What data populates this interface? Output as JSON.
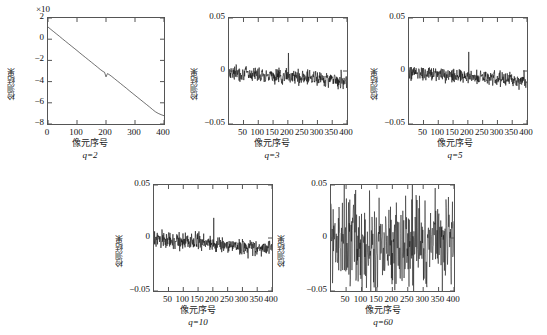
{
  "figure": {
    "axis_label_y": "检测结果",
    "axis_label_x": "像元序号",
    "exponent_note": "×10"
  },
  "chart_data": [
    {
      "type": "line",
      "title": "",
      "caption": "q=2",
      "xlabel": "像元序号",
      "ylabel": "检测结果",
      "xlim": [
        0,
        400
      ],
      "ylim": [
        -8,
        2
      ],
      "xticks": [
        0,
        100,
        200,
        300,
        400
      ],
      "yticks": [
        2,
        0,
        -2,
        -4,
        -6,
        -8
      ],
      "y_exponent": "×10",
      "grid": false,
      "legend": "none",
      "x": [
        0,
        10,
        20,
        30,
        40,
        50,
        60,
        70,
        80,
        90,
        100,
        110,
        120,
        130,
        140,
        150,
        160,
        170,
        180,
        190,
        195,
        200,
        205,
        210,
        220,
        230,
        240,
        250,
        260,
        270,
        280,
        290,
        300,
        310,
        320,
        330,
        340,
        350,
        360,
        370,
        380,
        390,
        400
      ],
      "values": [
        1.15,
        0.92,
        0.7,
        0.48,
        0.26,
        0.03,
        -0.19,
        -0.41,
        -0.63,
        -0.85,
        -1.07,
        -1.3,
        -1.52,
        -1.74,
        -1.96,
        -2.18,
        -2.4,
        -2.62,
        -2.85,
        -3.05,
        -3.12,
        -3.55,
        -3.25,
        -3.32,
        -3.52,
        -3.74,
        -3.96,
        -4.18,
        -4.4,
        -4.62,
        -4.85,
        -5.07,
        -5.29,
        -5.51,
        -5.73,
        -5.95,
        -6.17,
        -6.39,
        -6.62,
        -6.84,
        -7.0,
        -7.12,
        -7.22
      ]
    },
    {
      "type": "line",
      "title": "",
      "caption": "q=3",
      "xlabel": "像元序号",
      "ylabel": "检测结果",
      "xlim": [
        1,
        400
      ],
      "ylim": [
        -0.05,
        0.05
      ],
      "xticks": [
        50,
        100,
        150,
        200,
        250,
        300,
        350,
        400
      ],
      "yticks": [
        0.05,
        0,
        -0.05
      ],
      "grid": false,
      "legend": "none",
      "noise_amplitude": 0.0035,
      "baseline_start": -0.001,
      "baseline_end": -0.009,
      "spike_x": 202,
      "spike_y": 0.017,
      "seed": 7
    },
    {
      "type": "line",
      "title": "",
      "caption": "q=5",
      "xlabel": "像元序号",
      "ylabel": "检测结果",
      "xlim": [
        1,
        400
      ],
      "ylim": [
        -0.05,
        0.05
      ],
      "xticks": [
        50,
        100,
        150,
        200,
        250,
        300,
        350,
        400
      ],
      "yticks": [
        0.05,
        0,
        -0.05
      ],
      "grid": false,
      "legend": "none",
      "noise_amplitude": 0.0035,
      "baseline_start": -0.001,
      "baseline_end": -0.009,
      "spike_x": 203,
      "spike_y": 0.018,
      "seed": 19
    },
    {
      "type": "line",
      "title": "",
      "caption": "q=10",
      "xlabel": "像元序号",
      "ylabel": "检测结果",
      "xlim": [
        1,
        400
      ],
      "ylim": [
        -0.05,
        0.05
      ],
      "xticks": [
        50,
        100,
        150,
        200,
        250,
        300,
        350,
        400
      ],
      "yticks": [
        0.05,
        0,
        -0.05
      ],
      "grid": false,
      "legend": "none",
      "noise_amplitude": 0.004,
      "baseline_start": -0.001,
      "baseline_end": -0.01,
      "spike_x": 203,
      "spike_y": 0.019,
      "seed": 31
    },
    {
      "type": "line",
      "title": "",
      "caption": "q=60",
      "xlabel": "像元序号",
      "ylabel": "检测结果",
      "xlim": [
        1,
        400
      ],
      "ylim": [
        -0.05,
        0.05
      ],
      "xticks": [
        50,
        100,
        150,
        200,
        250,
        300,
        350,
        400
      ],
      "yticks": [
        0.05,
        0,
        -0.05
      ],
      "grid": false,
      "legend": "none",
      "noise_amplitude": 0.021,
      "baseline_start": -0.004,
      "baseline_end": -0.006,
      "spike_x": null,
      "spike_y": null,
      "seed": 57
    }
  ]
}
